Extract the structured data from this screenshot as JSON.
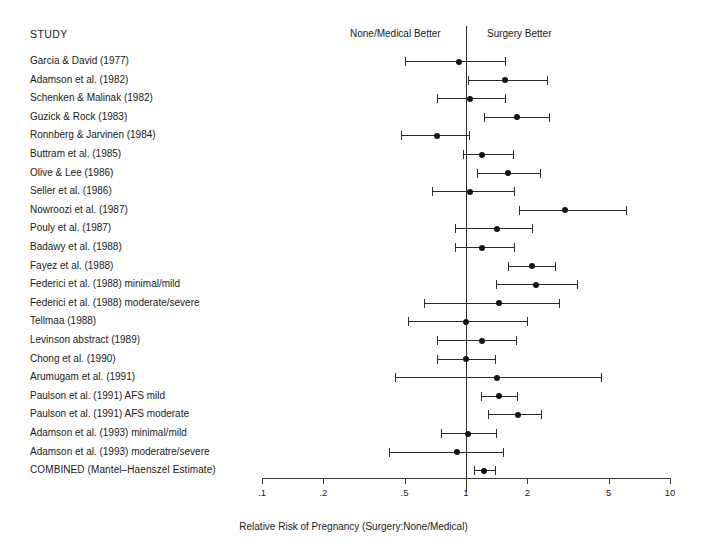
{
  "header": {
    "study_column_title": "STUDY",
    "left_side_label": "None/Medical Better",
    "right_side_label": "Surgery Better"
  },
  "chart_data": {
    "type": "forest",
    "title": "",
    "xlabel": "Relative Risk of Pregnancy (Surgery:None/Medical)",
    "ylabel": "",
    "xscale": "log",
    "xlim": [
      0.1,
      10
    ],
    "grid": false,
    "reference_line": 1,
    "legend_position": "none",
    "tick_values": [
      0.1,
      0.2,
      0.5,
      1,
      2,
      5,
      10
    ],
    "tick_labels": [
      ".1",
      ".2",
      ".5",
      "1",
      "2",
      "5",
      "10"
    ],
    "annotations": [
      "None/Medical Better",
      "Surgery Better"
    ],
    "columns": [
      "Study",
      "Estimate",
      "CI low",
      "CI high"
    ],
    "rows": [
      {
        "label": "Garcia & David (1977)",
        "estimate": 0.92,
        "low": 0.5,
        "high": 1.55,
        "combined": false
      },
      {
        "label": "Adamson et al. (1982)",
        "estimate": 1.55,
        "low": 1.02,
        "high": 2.5,
        "combined": false
      },
      {
        "label": "Schenken & Malinak (1982)",
        "estimate": 1.05,
        "low": 0.72,
        "high": 1.55,
        "combined": false
      },
      {
        "label": "Guzick & Rock (1983)",
        "estimate": 1.78,
        "low": 1.22,
        "high": 2.55,
        "combined": false
      },
      {
        "label": "Ronnberg & Jarvinen (1984)",
        "estimate": 0.72,
        "low": 0.48,
        "high": 1.03,
        "combined": false
      },
      {
        "label": "Buttram et al. (1985)",
        "estimate": 1.2,
        "low": 0.97,
        "high": 1.7,
        "combined": false
      },
      {
        "label": "Olive & Lee (1986)",
        "estimate": 1.6,
        "low": 1.13,
        "high": 2.3,
        "combined": false
      },
      {
        "label": "Seller et al. (1986)",
        "estimate": 1.05,
        "low": 0.68,
        "high": 1.72,
        "combined": false
      },
      {
        "label": "Nowroozi et al. (1987)",
        "estimate": 3.05,
        "low": 1.82,
        "high": 6.1,
        "combined": false
      },
      {
        "label": "Pouly et al. (1987)",
        "estimate": 1.42,
        "low": 0.88,
        "high": 2.1,
        "combined": false
      },
      {
        "label": "Badawy et al. (1988)",
        "estimate": 1.2,
        "low": 0.88,
        "high": 1.72,
        "combined": false
      },
      {
        "label": "Fayez et al. (1988)",
        "estimate": 2.1,
        "low": 1.6,
        "high": 2.72,
        "combined": false
      },
      {
        "label": "Federici et al. (1988) minimal/mild",
        "estimate": 2.2,
        "low": 1.4,
        "high": 3.5,
        "combined": false
      },
      {
        "label": "Federici et al. (1988) moderate/severe",
        "estimate": 1.45,
        "low": 0.62,
        "high": 2.85,
        "combined": false
      },
      {
        "label": "Tellmaa (1988)",
        "estimate": 1.0,
        "low": 0.52,
        "high": 2.0,
        "combined": false
      },
      {
        "label": "Levinson abstract (1989)",
        "estimate": 1.2,
        "low": 0.72,
        "high": 1.75,
        "combined": false
      },
      {
        "label": "Chong et al. (1990)",
        "estimate": 1.0,
        "low": 0.72,
        "high": 1.38,
        "combined": false
      },
      {
        "label": "Arumugam et al. (1991)",
        "estimate": 1.42,
        "low": 0.45,
        "high": 4.6,
        "combined": false
      },
      {
        "label": "Paulson et al. (1991) AFS mild",
        "estimate": 1.45,
        "low": 1.18,
        "high": 1.78,
        "combined": false
      },
      {
        "label": "Paulson et al. (1991) AFS moderate",
        "estimate": 1.8,
        "low": 1.28,
        "high": 2.32,
        "combined": false
      },
      {
        "label": "Adamson et al. (1993) minimal/mild",
        "estimate": 1.02,
        "low": 0.75,
        "high": 1.4,
        "combined": false
      },
      {
        "label": "Adamson et al. (1993) moderatre/severe",
        "estimate": 0.9,
        "low": 0.42,
        "high": 1.52,
        "combined": false
      },
      {
        "label": "COMBINED (Mantel–Haenszel Estimate)",
        "estimate": 1.22,
        "low": 1.1,
        "high": 1.38,
        "combined": true
      }
    ]
  }
}
